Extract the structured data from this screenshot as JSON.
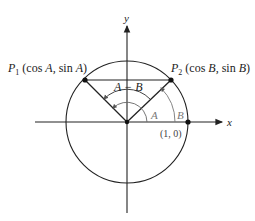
{
  "diagram": {
    "title": "",
    "axes": {
      "x_label": "x",
      "y_label": "y"
    },
    "points": {
      "p1": {
        "name": "P",
        "subscript": "1",
        "coords_label": "(cos A, sin A)",
        "cos_part": "(cos ",
        "cos_var": "A",
        "sin_part": ", sin ",
        "sin_var": "A",
        "close": ")"
      },
      "p2": {
        "name": "P",
        "subscript": "2",
        "coords_label": "(cos B, sin B)",
        "cos_part": "(cos ",
        "cos_var": "B",
        "sin_part": ", sin ",
        "sin_var": "B",
        "close": ")"
      },
      "unit": {
        "label": "(1, 0)"
      }
    },
    "angles": {
      "a": "A",
      "b": "B",
      "diff": "A − B"
    },
    "colors": {
      "stroke": "#222222",
      "arc": "#777777"
    }
  }
}
